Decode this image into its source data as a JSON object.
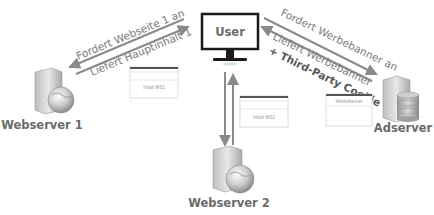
{
  "nodes": {
    "user": "User",
    "webserver1": "Webserver 1",
    "webserver2": "Webserver 2",
    "adserver": "Adserver"
  },
  "arrows": {
    "request_ws1": "Fordert Webseite 1 an",
    "response_ws1": "Liefert Hauptinhalt 1",
    "request_ad": "Fordert Werbebanner an",
    "response_ad": "Liefert Werbebanner",
    "response_ad_extra": "+ Third-Party Cookie"
  },
  "content_boxes": {
    "ws1": "Inhalt WS1",
    "ws2": "Inhalt WS2",
    "ad": "Werbebanner"
  },
  "colors": {
    "arrow": "#8a8a8a",
    "text": "#7a7a7a",
    "monitor": "#1a1a1a"
  }
}
